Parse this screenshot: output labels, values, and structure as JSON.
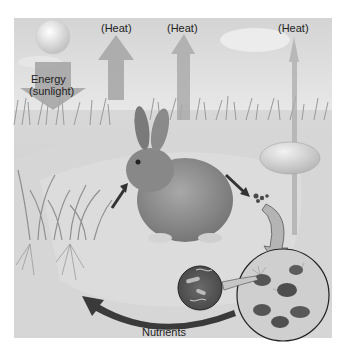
{
  "diagram": {
    "type": "energy-flow-and-nutrient-cycle",
    "labels": {
      "energy": "Energy",
      "energy_source": "(sunlight)",
      "heat_1": "(Heat)",
      "heat_2": "(Heat)",
      "heat_3": "(Heat)",
      "nutrients": "Nutrients"
    },
    "elements": [
      "sun",
      "energy-arrow-down",
      "heat-arrow-up-1",
      "heat-arrow-up-2",
      "heat-arrow-up-3",
      "grass-with-roots",
      "rabbit",
      "rock",
      "droppings",
      "decomposer-magnified-circle",
      "bacteria-magnified-circle",
      "nutrient-return-arrow"
    ]
  }
}
